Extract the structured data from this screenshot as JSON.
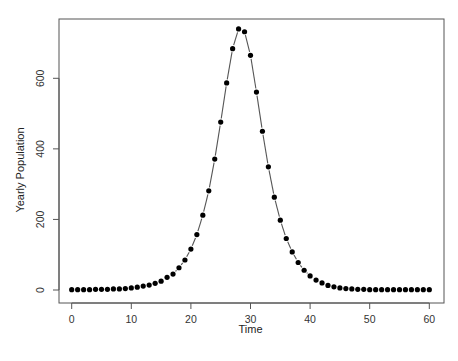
{
  "chart_data": {
    "type": "line",
    "style": "points connected by dashed line (type='b')",
    "title": "",
    "xlabel": "Time",
    "ylabel": "Yearly Population",
    "xlim": [
      0,
      60
    ],
    "ylim": [
      0,
      750
    ],
    "x_ticks": [
      0,
      10,
      20,
      30,
      40,
      50,
      60
    ],
    "y_ticks": [
      0,
      200,
      400,
      600
    ],
    "grid": false,
    "legend": null,
    "series": [
      {
        "name": "Yearly Population",
        "x": [
          0,
          1,
          2,
          3,
          4,
          5,
          6,
          7,
          8,
          9,
          10,
          11,
          12,
          13,
          14,
          15,
          16,
          17,
          18,
          19,
          20,
          21,
          22,
          23,
          24,
          25,
          26,
          27,
          28,
          29,
          30,
          31,
          32,
          33,
          34,
          35,
          36,
          37,
          38,
          39,
          40,
          41,
          42,
          43,
          44,
          45,
          46,
          47,
          48,
          49,
          50,
          51,
          52,
          53,
          54,
          55,
          56,
          57,
          58,
          59,
          60
        ],
        "values": [
          1,
          1,
          1,
          1,
          2,
          2,
          2,
          3,
          3,
          4,
          6,
          8,
          11,
          14,
          19,
          25,
          36,
          45,
          63,
          85,
          116,
          157,
          212,
          281,
          371,
          476,
          587,
          684,
          740,
          732,
          665,
          561,
          450,
          349,
          263,
          198,
          146,
          108,
          78,
          56,
          40,
          28,
          20,
          13,
          9,
          6,
          4,
          3,
          2,
          2,
          1,
          1,
          1,
          1,
          1,
          1,
          1,
          1,
          1,
          1,
          1
        ]
      }
    ]
  },
  "axes": {
    "xlabel": "Time",
    "ylabel": "Yearly Population",
    "x_tick_labels": [
      "0",
      "10",
      "20",
      "30",
      "40",
      "50",
      "60"
    ],
    "y_tick_labels": [
      "0",
      "200",
      "400",
      "600"
    ]
  },
  "colors": {
    "points": "#000000",
    "line": "#555555",
    "frame": "#555555",
    "background": "#ffffff"
  }
}
